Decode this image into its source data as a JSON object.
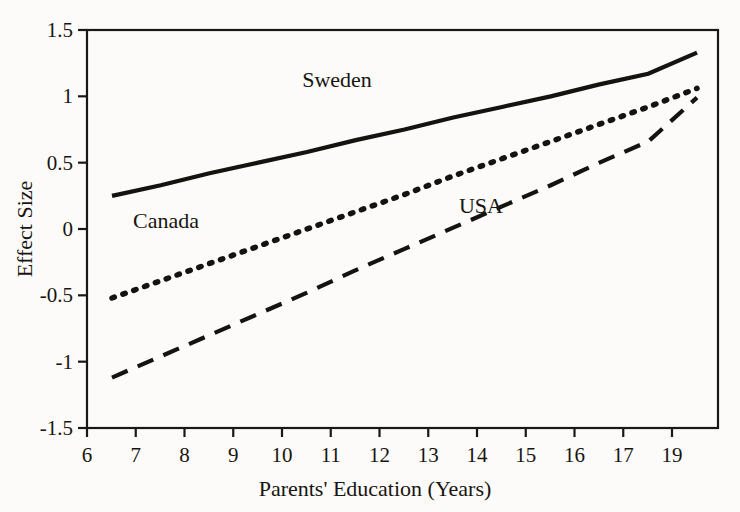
{
  "chart_data": {
    "type": "line",
    "title": "",
    "xlabel": "Parents' Education (Years)",
    "ylabel": "Effect Size",
    "xlim": [
      6,
      19
    ],
    "ylim": [
      -1.5,
      1.5
    ],
    "grid": false,
    "legend_position": "inline-annotations",
    "x_tick_labels": [
      "6",
      "7",
      "8",
      "9",
      "10",
      "11",
      "12",
      "13",
      "14",
      "15",
      "16",
      "17",
      "19"
    ],
    "y_tick_labels": [
      "1.5",
      "1",
      "0.5",
      "0",
      "-0.5",
      "-1",
      "-1.5"
    ],
    "y_tick_values": [
      1.5,
      1,
      0.5,
      0,
      -0.5,
      -1,
      -1.5
    ],
    "x": [
      6,
      7,
      8,
      9,
      10,
      11,
      12,
      13,
      14,
      15,
      16,
      17,
      19
    ],
    "series": [
      {
        "name": "Sweden",
        "style": "solid",
        "color": "#151310",
        "values": [
          0.25,
          0.33,
          0.42,
          0.5,
          0.58,
          0.67,
          0.75,
          0.84,
          0.92,
          1.0,
          1.09,
          1.17,
          1.33
        ],
        "label_x": 11.0,
        "label_y": 1.07
      },
      {
        "name": "Canada",
        "style": "dotted",
        "color": "#151310",
        "values": [
          -0.52,
          -0.39,
          -0.26,
          -0.13,
          0.0,
          0.13,
          0.26,
          0.4,
          0.53,
          0.66,
          0.79,
          0.92,
          1.06
        ],
        "label_x": 7.2,
        "label_y": 0.01
      },
      {
        "name": "USA",
        "style": "dashed",
        "color": "#151310",
        "values": [
          -1.12,
          -0.96,
          -0.8,
          -0.64,
          -0.48,
          -0.31,
          -0.15,
          0.01,
          0.17,
          0.33,
          0.5,
          0.66,
          0.99
        ],
        "label_x": 14.2,
        "label_y": 0.12
      }
    ]
  },
  "axes": {
    "y_axis_title": "Effect Size",
    "x_axis_title": "Parents' Education (Years)"
  },
  "annotations": {
    "sweden_label": "Sweden",
    "canada_label": "Canada",
    "usa_label": "USA"
  }
}
